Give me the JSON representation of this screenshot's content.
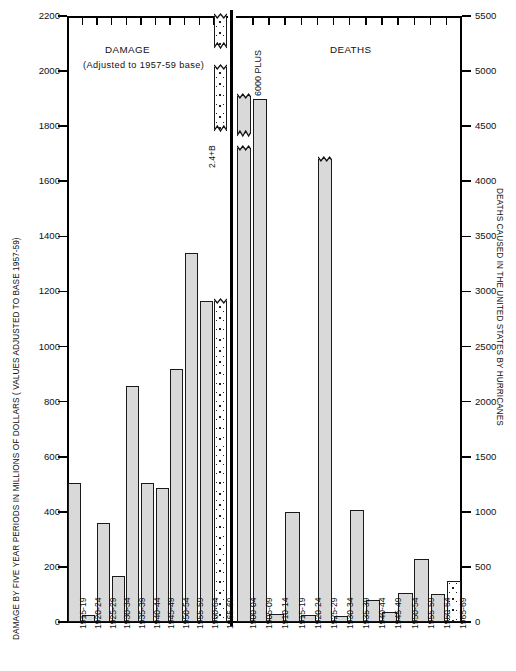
{
  "chart_data": [
    {
      "type": "bar",
      "panel": "damage",
      "title": "DAMAGE",
      "subtitle": "(Adjusted to 1957-59 base)",
      "ylabel": "DAMAGE BY FIVE YEAR PERIODS IN MILLIONS OF DOLLARS ( VALUES ADJUSTED TO BASE 1957-59)",
      "xlabel": "",
      "ylim": [
        0,
        2200
      ],
      "ytick_step": 200,
      "ytick_labels": [
        "0",
        "200",
        "400",
        "600",
        "800",
        "1000",
        "1200",
        "1400",
        "1600",
        "1800",
        "2000",
        "2200"
      ],
      "grid": false,
      "legend": "none",
      "annotation": "2.4+B",
      "annotation_note": "1965-69 bar is broken; actual value 2.4 billion dollars",
      "categories": [
        "1915-19",
        "1920-24",
        "1925-29",
        "1930-34",
        "1935-39",
        "1940-44",
        "1945-49",
        "1950-54",
        "1955-59",
        "1960-64",
        "1965-69"
      ],
      "values": [
        505,
        25,
        358,
        168,
        855,
        505,
        487,
        920,
        1340,
        1165,
        2400
      ],
      "broken_bar_index": 10,
      "broken_bar_drawn_to": 1167,
      "fills": [
        "hatch",
        "hatch",
        "hatch",
        "hatch",
        "hatch",
        "hatch",
        "hatch",
        "hatch",
        "hatch",
        "hatch",
        "dotted"
      ]
    },
    {
      "type": "bar",
      "panel": "deaths",
      "title": "DEATHS",
      "subtitle": "",
      "ylabel": "DEATHS CAUSED IN THE UNITED STATES BY HURRICANES",
      "xlabel": "",
      "ylim": [
        0,
        5500
      ],
      "ytick_step": 500,
      "ytick_labels": [
        "0",
        "500",
        "1000",
        "1500",
        "2000",
        "2500",
        "3000",
        "3500",
        "4000",
        "4500",
        "5000",
        "5500"
      ],
      "grid": false,
      "legend": "none",
      "annotation": "6000 PLUS",
      "annotation_note": "1900-04 bar is broken; actual value exceeds 6000 deaths",
      "categories": [
        "1900-04",
        "1905-09",
        "1910-14",
        "1915-19",
        "1920-24",
        "1925-29",
        "1930-34",
        "1935-39",
        "1940-44",
        "1945-49",
        "1950-54",
        "1955-59",
        "1960-64",
        "1965-69"
      ],
      "values": [
        6000,
        4750,
        75,
        1000,
        60,
        4200,
        55,
        1020,
        200,
        95,
        265,
        570,
        250,
        375
      ],
      "broken_bar_indices": [
        0,
        5
      ],
      "broken_bar_0_segments": [
        [
          0,
          4300
        ],
        [
          4430,
          4770
        ]
      ],
      "broken_bar_5_drawn_to": 4200,
      "fills": [
        "hatch",
        "hatch",
        "hatch",
        "hatch",
        "hatch",
        "hatch",
        "hatch",
        "hatch",
        "hatch",
        "hatch",
        "hatch",
        "hatch",
        "hatch",
        "dotted"
      ]
    }
  ],
  "axes": {
    "left_title": "DAMAGE BY FIVE YEAR PERIODS IN MILLIONS OF DOLLARS ( VALUES ADJUSTED TO BASE 1957-59)",
    "right_title": "DEATHS CAUSED IN THE UNITED STATES BY HURRICANES"
  },
  "captions": {
    "damage": "DAMAGE",
    "damage_sub": "(Adjusted to 1957-59 base)",
    "deaths": "DEATHS",
    "damage_break_label": "2.4+B",
    "deaths_break_label": "6000 PLUS"
  }
}
